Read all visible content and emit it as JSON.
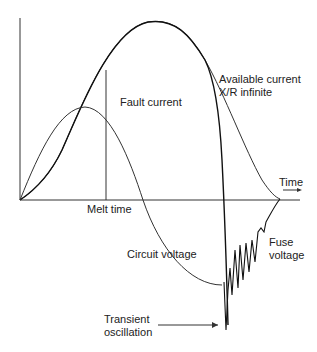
{
  "labels": {
    "fault_current": "Fault current",
    "available_current_1": "Available current",
    "available_current_2": "X/R infinite",
    "time": "Time",
    "melt_time": "Melt time",
    "circuit_voltage": "Circuit voltage",
    "fuse_voltage_1": "Fuse",
    "fuse_voltage_2": "voltage",
    "transient_1": "Transient",
    "transient_2": "oscillation"
  },
  "colors": {
    "line": "#222222",
    "background": "#ffffff"
  }
}
